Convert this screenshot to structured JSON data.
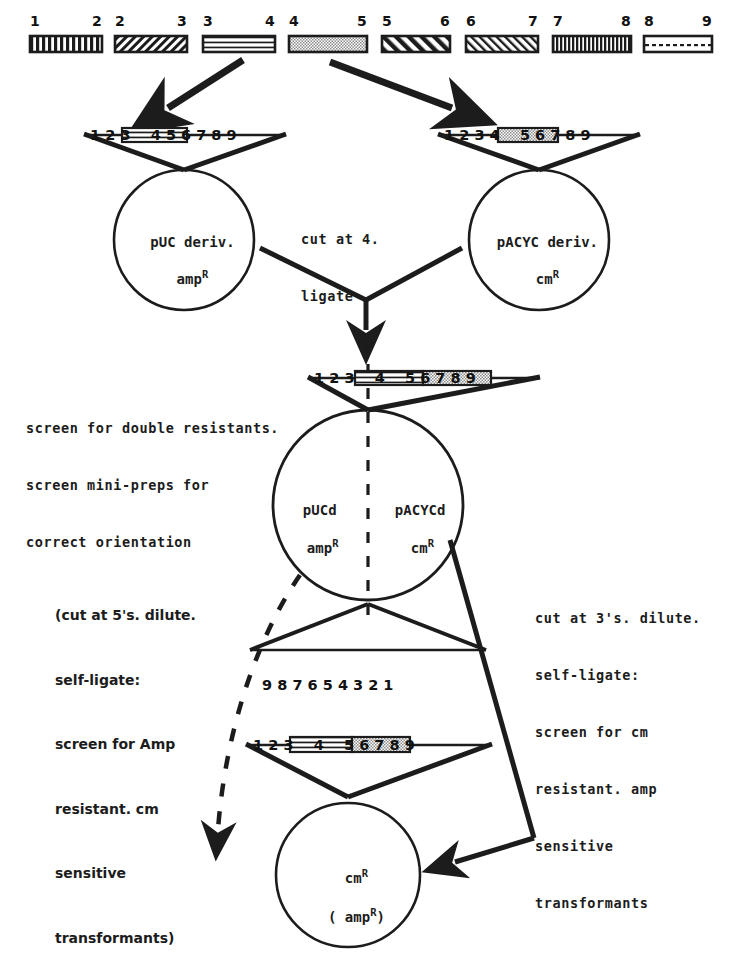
{
  "diagram": {
    "top_fragments": [
      {
        "left_label": "1",
        "right_label": "2",
        "pattern": "dense-vertical-bars"
      },
      {
        "left_label": "2",
        "right_label": "3",
        "pattern": "fine-right-diagonal"
      },
      {
        "left_label": "3",
        "right_label": "4",
        "pattern": "horizontal-lines"
      },
      {
        "left_label": "4",
        "right_label": "5",
        "pattern": "stipple-gray"
      },
      {
        "left_label": "5",
        "right_label": "6",
        "pattern": "bold-left-diagonal"
      },
      {
        "left_label": "6",
        "right_label": "7",
        "pattern": "thin-left-diagonal"
      },
      {
        "left_label": "7",
        "right_label": "8",
        "pattern": "very-dense-vertical"
      },
      {
        "left_label": "8",
        "right_label": "9",
        "pattern": "dotted-line"
      }
    ],
    "scale_numbers": [
      "1",
      "2",
      "3",
      "4",
      "5",
      "6",
      "7",
      "8",
      "9"
    ],
    "scale_numbers_reversed": [
      "9",
      "8",
      "7",
      "6",
      "5",
      "4",
      "3",
      "2",
      "1"
    ],
    "plasmids": {
      "upper_left": {
        "name": "pUC deriv.",
        "marker": "amp",
        "marker_sup": "R",
        "insert": "fragment 3-4"
      },
      "upper_right": {
        "name": "pACYC deriv.",
        "marker": "cm",
        "marker_sup": "R",
        "insert": "fragment 4-5"
      },
      "middle_left_half": {
        "name": "pUCd",
        "marker": "amp",
        "marker_sup": "R"
      },
      "middle_right_half": {
        "name": "pACYCd",
        "marker": "cm",
        "marker_sup": "R"
      },
      "bottom": {
        "marker": "cm",
        "marker_sup": "R",
        "secondary": "( amp",
        "secondary_sup": "R",
        "secondary_close": ")"
      }
    },
    "annotations": {
      "center_step": [
        "cut at 4.",
        "ligate"
      ],
      "screen_step": [
        "screen for double resistants.",
        "screen mini-preps for",
        "correct orientation"
      ],
      "left_branch": [
        "(cut at 5's. dilute.",
        "self-ligate:",
        "screen for Amp",
        "resistant. cm",
        "sensitive",
        "transformants)"
      ],
      "right_branch": [
        "cut at 3's. dilute.",
        "self-ligate:",
        "screen for cm",
        "resistant. amp",
        "sensitive",
        "transformants"
      ]
    },
    "colors": {
      "ink": "#1c1c1c",
      "paper": "#ffffff",
      "fill_gray": "#d0d0d0"
    }
  }
}
